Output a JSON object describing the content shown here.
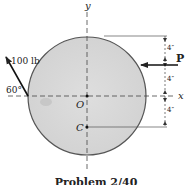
{
  "figure": {
    "caption": "Problem 2/40",
    "axes": {
      "x_label": "x",
      "y_label": "y"
    },
    "points": {
      "origin": "O",
      "centroid": "C"
    },
    "forces": [
      {
        "name": "applied-force",
        "label": "100 lb",
        "angle_label": "60°"
      },
      {
        "name": "force-P",
        "label": "P"
      }
    ],
    "dimensions": [
      "4″",
      "4″",
      "4″",
      "4″"
    ],
    "colors": {
      "disk_fill": "#d9d9d9",
      "disk_edge": "#555555",
      "line": "#333333"
    }
  }
}
